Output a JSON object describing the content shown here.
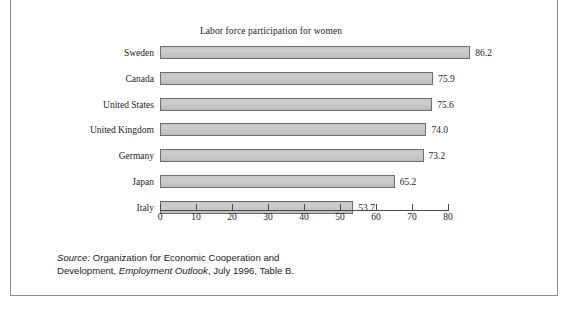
{
  "figure": {
    "title": "Labor force participation for women",
    "source_prefix": "Source:",
    "source_line1_rest": " Organization for Economic Cooperation and",
    "source_line2_a": "Development, ",
    "source_line2_italic": "Employment Outlook",
    "source_line2_b": ", July 1996, Table B."
  },
  "chart_data": {
    "type": "bar",
    "orientation": "horizontal",
    "title": "Labor force participation for women",
    "xlabel": "",
    "ylabel": "",
    "xlim": [
      0,
      80
    ],
    "xticks": [
      0,
      10,
      20,
      30,
      40,
      50,
      60,
      70,
      80
    ],
    "grid": false,
    "legend": "none",
    "categories": [
      "Sweden",
      "Canada",
      "United States",
      "United Kingdom",
      "Germany",
      "Japan",
      "Italy"
    ],
    "values": [
      86.2,
      75.9,
      75.6,
      74.0,
      73.2,
      65.2,
      53.7
    ],
    "value_labels": [
      "86.2",
      "75.9",
      "75.6",
      "74.0",
      "73.2",
      "65.2",
      "53.7"
    ],
    "bar_fill": "#c6c6c6",
    "bar_border": "#6e6e6e"
  }
}
